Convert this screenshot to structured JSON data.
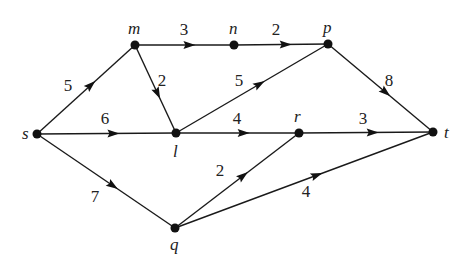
{
  "diagram": {
    "type": "directed-weighted-graph",
    "nodes": [
      {
        "id": "s",
        "label": "s",
        "x": 37,
        "y": 134,
        "lx": 22,
        "ly": 139
      },
      {
        "id": "m",
        "label": "m",
        "x": 135,
        "y": 45,
        "lx": 128,
        "ly": 34
      },
      {
        "id": "n",
        "label": "n",
        "x": 234,
        "y": 45,
        "lx": 229,
        "ly": 34
      },
      {
        "id": "p",
        "label": "p",
        "x": 328,
        "y": 44,
        "lx": 323,
        "ly": 33
      },
      {
        "id": "l",
        "label": "l",
        "x": 176,
        "y": 133,
        "lx": 173,
        "ly": 157
      },
      {
        "id": "r",
        "label": "r",
        "x": 299,
        "y": 133,
        "lx": 294,
        "ly": 122
      },
      {
        "id": "t",
        "label": "t",
        "x": 433,
        "y": 132,
        "lx": 444,
        "ly": 138
      },
      {
        "id": "q",
        "label": "q",
        "x": 175,
        "y": 228,
        "lx": 170,
        "ly": 250
      }
    ],
    "edges": [
      {
        "from": "s",
        "to": "m",
        "weight": "5",
        "lx": 68,
        "ly": 91,
        "t": 0.55
      },
      {
        "from": "s",
        "to": "l",
        "weight": "6",
        "lx": 105,
        "ly": 124,
        "t": 0.55
      },
      {
        "from": "s",
        "to": "q",
        "weight": "7",
        "lx": 95,
        "ly": 202,
        "t": 0.55
      },
      {
        "from": "m",
        "to": "n",
        "weight": "3",
        "lx": 184,
        "ly": 35,
        "t": 0.55
      },
      {
        "from": "m",
        "to": "l",
        "weight": "2",
        "lx": 162,
        "ly": 86,
        "t": 0.55
      },
      {
        "from": "n",
        "to": "p",
        "weight": "2",
        "lx": 276,
        "ly": 35,
        "t": 0.55
      },
      {
        "from": "l",
        "to": "p",
        "weight": "5",
        "lx": 239,
        "ly": 86,
        "t": 0.55
      },
      {
        "from": "l",
        "to": "r",
        "weight": "4",
        "lx": 237,
        "ly": 124,
        "t": 0.55
      },
      {
        "from": "p",
        "to": "t",
        "weight": "8",
        "lx": 389,
        "ly": 86,
        "t": 0.55
      },
      {
        "from": "r",
        "to": "t",
        "weight": "3",
        "lx": 363,
        "ly": 124,
        "t": 0.55
      },
      {
        "from": "q",
        "to": "r",
        "weight": "2",
        "lx": 220,
        "ly": 176,
        "t": 0.55
      },
      {
        "from": "q",
        "to": "t",
        "weight": "4",
        "lx": 306,
        "ly": 197,
        "t": 0.55
      }
    ],
    "colors": {
      "stroke": "#1a1a1a",
      "node": "#111111",
      "text": "#222222",
      "background": "#ffffff"
    }
  }
}
